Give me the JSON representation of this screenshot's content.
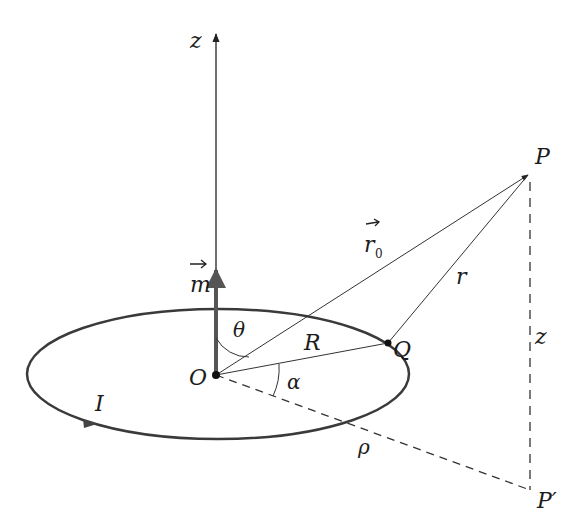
{
  "figure": {
    "labels": {
      "z_axis": "z",
      "moment": "m",
      "radius_vector": "r",
      "radius_vector_sub": "0",
      "distance_r": "r",
      "point_P": "P",
      "point_P_prime": "P′",
      "point_Q": "Q",
      "origin": "O",
      "angle_theta": "θ",
      "angle_alpha": "α",
      "loop_radius": "R",
      "current": "I",
      "height_z": "z",
      "rho": "ρ"
    },
    "colors": {
      "line": "#2a2a2a",
      "loop": "#3a3a3a",
      "moment": "#5a5a5a"
    }
  }
}
